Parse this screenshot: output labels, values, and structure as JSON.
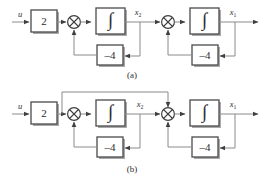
{
  "figure": {
    "background_color": "#ffffff",
    "line_color": "#8a8a8a",
    "block_stroke_color": "#4a4a4c",
    "text_color": "#2d2d2f",
    "diagrams": [
      {
        "id": "a",
        "caption": "(a)",
        "input_label": "u",
        "gain_block_label": "2",
        "integrator_symbol": "∫",
        "feedback_gain_1_label": "–4",
        "feedback_gain_2_label": "–4",
        "state_label_2": "x",
        "state_subscript_2": "2",
        "state_label_1": "x",
        "state_subscript_1": "1",
        "summing_junction_symbol": "⊗",
        "structure": "cascade of two integrators, each with its own local negative feedback of gain -4; input scaled by 2"
      },
      {
        "id": "b",
        "caption": "(b)",
        "input_label": "u",
        "gain_block_label": "2",
        "integrator_symbol": "∫",
        "feedback_gain_1_label": "–4",
        "feedback_gain_2_label": "–4",
        "state_label_2": "x",
        "state_subscript_2": "2",
        "state_label_1": "x",
        "state_subscript_1": "1",
        "summing_junction_symbol": "⊗",
        "structure": "same cascade as (a) plus a feedforward path from the output of the gain-2 block to the second summing junction"
      }
    ]
  }
}
